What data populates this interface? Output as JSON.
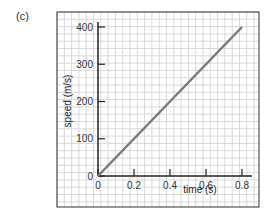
{
  "panel_label": "(c)",
  "chart_data": {
    "type": "line",
    "title": "",
    "xlabel": "time (s)",
    "ylabel": "speed (m/s)",
    "x_ticks": [
      "0",
      "0.2",
      "0.4",
      "0.6",
      "0.8"
    ],
    "y_ticks": [
      "0",
      "100",
      "200",
      "300",
      "400"
    ],
    "xlim": [
      0,
      0.8
    ],
    "ylim": [
      0,
      400
    ],
    "grid": true,
    "series": [
      {
        "name": "speed",
        "x": [
          0,
          0.8
        ],
        "values": [
          0,
          400
        ],
        "color": "#7a7a7a"
      }
    ]
  }
}
